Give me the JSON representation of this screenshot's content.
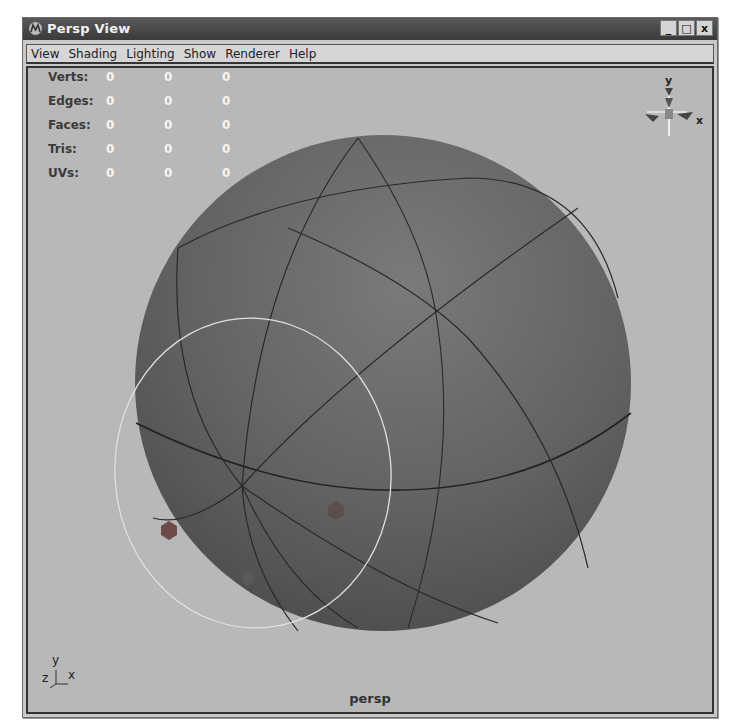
{
  "window": {
    "title": "Persp View",
    "controls": {
      "minimize": "_",
      "maximize": "□",
      "close": "x"
    }
  },
  "menu": {
    "items": [
      {
        "label": "View"
      },
      {
        "label": "Shading"
      },
      {
        "label": "Lighting"
      },
      {
        "label": "Show"
      },
      {
        "label": "Renderer"
      },
      {
        "label": "Help"
      }
    ]
  },
  "hud": {
    "rows": [
      {
        "label": "Verts:",
        "values": [
          "0",
          "0",
          "0"
        ]
      },
      {
        "label": "Edges:",
        "values": [
          "0",
          "0",
          "0"
        ]
      },
      {
        "label": "Faces:",
        "values": [
          "0",
          "0",
          "0"
        ]
      },
      {
        "label": "Tris:",
        "values": [
          "0",
          "0",
          "0"
        ]
      },
      {
        "label": "UVs:",
        "values": [
          "0",
          "0",
          "0"
        ]
      }
    ]
  },
  "view_cube": {
    "y_label": "y",
    "x_label": "x"
  },
  "axis_indicator": {
    "y": "y",
    "z": "z",
    "x": "x"
  },
  "camera_label": "persp",
  "colors": {
    "viewport_bg": "#b8b8b8",
    "sphere_fill": "#6a6a6a",
    "titlebar": "#444444",
    "selection_ring": "#e0e0e0"
  }
}
